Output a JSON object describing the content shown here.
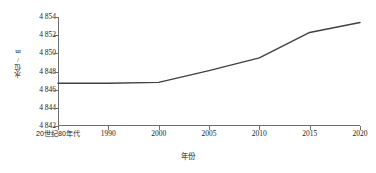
{
  "chart_data": {
    "type": "line",
    "title": "",
    "xlabel": "年份",
    "ylabel": "水位/m",
    "x": [
      "20世纪80年代",
      "1990",
      "2000",
      "2005",
      "2010",
      "2015",
      "2020"
    ],
    "categories": [
      "20世纪80年代",
      "1990",
      "2000",
      "2005",
      "2010",
      "2015",
      "2020"
    ],
    "series": [
      {
        "name": "水位",
        "values": [
          4846.7,
          4846.7,
          4846.8,
          4848.1,
          4849.5,
          4852.3,
          4853.4
        ]
      }
    ],
    "values": [
      4846.7,
      4846.7,
      4846.8,
      4848.1,
      4849.5,
      4852.3,
      4853.4
    ],
    "ylim": [
      4842,
      4854
    ],
    "yticks": [
      4842,
      4844,
      4846,
      4848,
      4850,
      4852,
      4854
    ],
    "ytick_labels": [
      "4 842",
      "4 844",
      "4 846",
      "4 848",
      "4 850",
      "4 852",
      "4 854"
    ],
    "grid": false,
    "legend": null,
    "line_color": "#404040",
    "axis_color": "#6f6f6f"
  },
  "axes": {
    "y_title": "水位/m",
    "x_title": "年份",
    "y_ticks": [
      {
        "label": "4 854",
        "value": 4854
      },
      {
        "label": "4 852",
        "value": 4852
      },
      {
        "label": "4 850",
        "value": 4850
      },
      {
        "label": "4 848",
        "value": 4848
      },
      {
        "label": "4 846",
        "value": 4846
      },
      {
        "label": "4 844",
        "value": 4844
      },
      {
        "label": "4 842",
        "value": 4842
      }
    ],
    "x_ticks": [
      {
        "label": "20世纪80年代",
        "cjk": true
      },
      {
        "label": "1990",
        "cjk": false
      },
      {
        "label": "2000",
        "cjk": false
      },
      {
        "label": "2005",
        "cjk": false
      },
      {
        "label": "2010",
        "cjk": false
      },
      {
        "label": "2015",
        "cjk": false
      },
      {
        "label": "2020",
        "cjk": false
      }
    ]
  }
}
